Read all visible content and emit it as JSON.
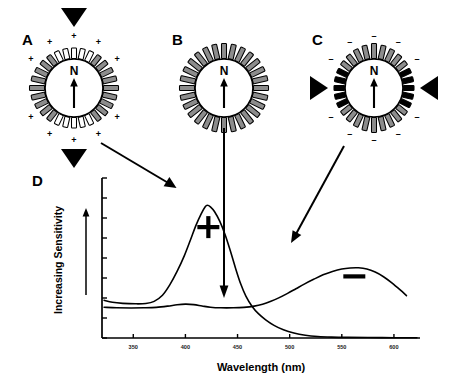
{
  "figure": {
    "panels": [
      {
        "id": "A",
        "label": "A",
        "core_letter": "N",
        "charge_symbol": "+",
        "charge_count_top": 5,
        "charge_count_bottom": 5,
        "spoke_count": 28,
        "spoke_fill_axial": "#ffffff",
        "spoke_fill_lateral": "#8c8c8c",
        "compression_axis": "vertical",
        "triangle_positions": [
          "top",
          "bottom"
        ],
        "cx": 74,
        "cy": 88
      },
      {
        "id": "B",
        "label": "B",
        "core_letter": "N",
        "charge_symbol": "",
        "charge_count_top": 0,
        "charge_count_bottom": 0,
        "spoke_count": 28,
        "spoke_fill_axial": "#8c8c8c",
        "spoke_fill_lateral": "#8c8c8c",
        "compression_axis": "none",
        "triangle_positions": [],
        "cx": 224,
        "cy": 88
      },
      {
        "id": "C",
        "label": "C",
        "core_letter": "N",
        "charge_symbol": "-",
        "charge_count_top": 5,
        "charge_count_bottom": 5,
        "spoke_count": 28,
        "spoke_fill_axial": "#000000",
        "spoke_fill_lateral": "#8c8c8c",
        "compression_axis": "horizontal",
        "triangle_positions": [
          "left",
          "right"
        ],
        "cx": 374,
        "cy": 88
      }
    ],
    "plot_panel": {
      "id": "D",
      "label": "D"
    },
    "connectors": [
      {
        "from": "A",
        "to": "peak-plus",
        "kind": "diagonal-down-right"
      },
      {
        "from": "B",
        "to": "crossover",
        "kind": "vertical-down"
      },
      {
        "from": "C",
        "to": "peak-minus",
        "kind": "diagonal-down-left"
      }
    ]
  },
  "chart_data": {
    "type": "line",
    "title": "",
    "xlabel": "Wavelength (nm)",
    "ylabel": "Increasing Sensitivity",
    "xlim": [
      320,
      625
    ],
    "ylim": [
      0,
      1
    ],
    "xticks": [
      350,
      400,
      450,
      500,
      550,
      600
    ],
    "xtick_labels": [
      "350",
      "400",
      "450",
      "500",
      "550",
      "600"
    ],
    "ytick_labels": [],
    "ytick_count": 9,
    "grid": false,
    "legend": "none",
    "annotations": [
      {
        "text": "+",
        "x": 422,
        "y": 0.72,
        "series": "positive-compression"
      },
      {
        "text": "—",
        "x": 562,
        "y": 0.4,
        "series": "negative-compression"
      }
    ],
    "series": [
      {
        "name": "positive-compression",
        "label": "+",
        "peak_nm": 421,
        "peak_value": 0.86,
        "baseline": 0.22,
        "points": [
          [
            322,
            0.245
          ],
          [
            330,
            0.232
          ],
          [
            340,
            0.225
          ],
          [
            352,
            0.222
          ],
          [
            362,
            0.224
          ],
          [
            370,
            0.238
          ],
          [
            378,
            0.278
          ],
          [
            385,
            0.345
          ],
          [
            392,
            0.432
          ],
          [
            399,
            0.535
          ],
          [
            405,
            0.64
          ],
          [
            410,
            0.73
          ],
          [
            415,
            0.805
          ],
          [
            419,
            0.852
          ],
          [
            421,
            0.862
          ],
          [
            424,
            0.852
          ],
          [
            428,
            0.82
          ],
          [
            433,
            0.757
          ],
          [
            438,
            0.672
          ],
          [
            443,
            0.568
          ],
          [
            448,
            0.455
          ],
          [
            453,
            0.352
          ],
          [
            458,
            0.272
          ],
          [
            464,
            0.205
          ],
          [
            470,
            0.158
          ],
          [
            477,
            0.118
          ],
          [
            485,
            0.082
          ],
          [
            494,
            0.053
          ],
          [
            504,
            0.032
          ],
          [
            515,
            0.018
          ],
          [
            527,
            0.01
          ],
          [
            540,
            0.006
          ],
          [
            556,
            0.004
          ],
          [
            575,
            0.003
          ],
          [
            600,
            0.002
          ],
          [
            622,
            0.002
          ]
        ]
      },
      {
        "name": "negative-compression",
        "label": "—",
        "peak_nm": 565,
        "peak_value": 0.455,
        "baseline": 0.195,
        "points": [
          [
            322,
            0.2
          ],
          [
            334,
            0.196
          ],
          [
            348,
            0.195
          ],
          [
            360,
            0.196
          ],
          [
            372,
            0.199
          ],
          [
            383,
            0.207
          ],
          [
            392,
            0.216
          ],
          [
            400,
            0.22
          ],
          [
            408,
            0.217
          ],
          [
            416,
            0.208
          ],
          [
            424,
            0.2
          ],
          [
            434,
            0.196
          ],
          [
            446,
            0.196
          ],
          [
            456,
            0.199
          ],
          [
            466,
            0.207
          ],
          [
            474,
            0.219
          ],
          [
            482,
            0.238
          ],
          [
            490,
            0.262
          ],
          [
            498,
            0.29
          ],
          [
            506,
            0.32
          ],
          [
            514,
            0.35
          ],
          [
            523,
            0.381
          ],
          [
            532,
            0.41
          ],
          [
            541,
            0.432
          ],
          [
            550,
            0.448
          ],
          [
            558,
            0.455
          ],
          [
            566,
            0.456
          ],
          [
            574,
            0.448
          ],
          [
            582,
            0.428
          ],
          [
            590,
            0.398
          ],
          [
            598,
            0.358
          ],
          [
            606,
            0.312
          ],
          [
            612,
            0.275
          ]
        ]
      }
    ]
  }
}
